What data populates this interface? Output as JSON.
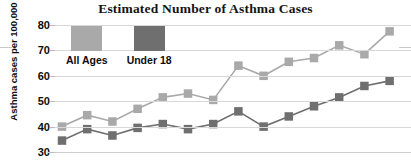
{
  "chart_data": {
    "type": "line",
    "title": "Estimated Number of Asthma Cases",
    "xlabel": "",
    "ylabel": "Asthma cases per 100,000",
    "ylim": [
      30,
      80
    ],
    "yticks": [
      30,
      40,
      50,
      60,
      70,
      80
    ],
    "ytick_labels": [
      "30",
      "40",
      "50",
      "60",
      "70",
      "80"
    ],
    "grid": true,
    "legend_position": "top-left-inside",
    "x": [
      1,
      2,
      3,
      4,
      5,
      6,
      7,
      8,
      9,
      10,
      11,
      12,
      13,
      14
    ],
    "series": [
      {
        "name": "All Ages",
        "color": "#a9a9a9",
        "values": [
          40,
          44.5,
          42,
          47,
          51.5,
          53,
          50.5,
          64,
          60,
          65.5,
          67,
          72,
          68.5,
          77.5
        ]
      },
      {
        "name": "Under 18",
        "color": "#6f6f6f",
        "values": [
          34.5,
          39,
          36.5,
          39.5,
          41,
          39,
          41,
          46,
          40,
          44,
          48,
          51.5,
          56,
          58
        ]
      }
    ]
  },
  "legend": {
    "items": [
      {
        "label": "All Ages",
        "color": "#a9a9a9"
      },
      {
        "label": "Under 18",
        "color": "#6f6f6f"
      }
    ]
  }
}
